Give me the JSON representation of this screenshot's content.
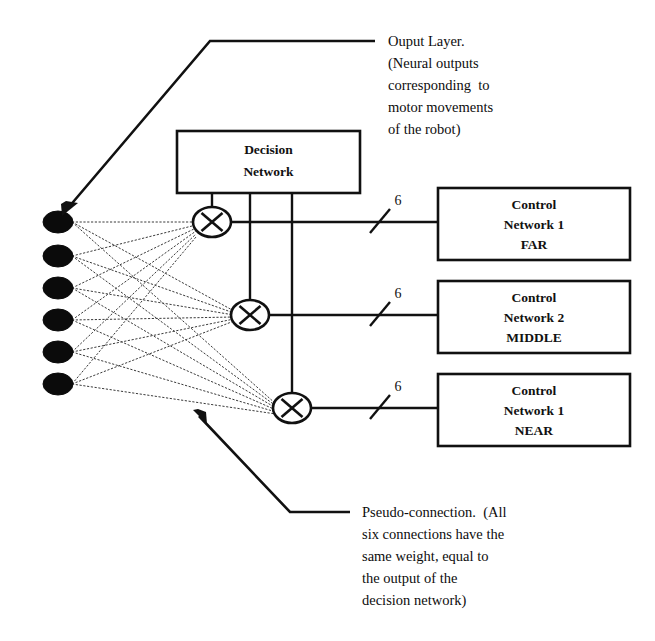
{
  "figure": {
    "background_color": "#ffffff",
    "ink_color": "#111111"
  },
  "output_layer": {
    "neuron_count": 6,
    "neuron_color": "#0b0b0b",
    "annotation_lines": [
      "Ouput Layer.",
      "(Neural outputs",
      "corresponding  to",
      "motor movements",
      "of the robot)"
    ]
  },
  "decision_network": {
    "label_lines": [
      "Decision",
      "Network"
    ],
    "output_branch_count": 3
  },
  "multipliers": [
    {
      "name": "multiplier-far",
      "symbol": "⊗"
    },
    {
      "name": "multiplier-middle",
      "symbol": "⊗"
    },
    {
      "name": "multiplier-near",
      "symbol": "⊗"
    }
  ],
  "buses": [
    {
      "width_label": "6"
    },
    {
      "width_label": "6"
    },
    {
      "width_label": "6"
    }
  ],
  "control_networks": [
    {
      "line1": "Control",
      "line2": "Network 1",
      "line3": "FAR"
    },
    {
      "line1": "Control",
      "line2": "Network 2",
      "line3": "MIDDLE"
    },
    {
      "line1": "Control",
      "line2": "Network 1",
      "line3": "NEAR"
    }
  ],
  "pseudo_connection": {
    "annotation_lines": [
      "Pseudo-connection.  (All",
      "six connections have the",
      "same weight, equal to",
      "the output of the",
      "decision network)"
    ]
  }
}
